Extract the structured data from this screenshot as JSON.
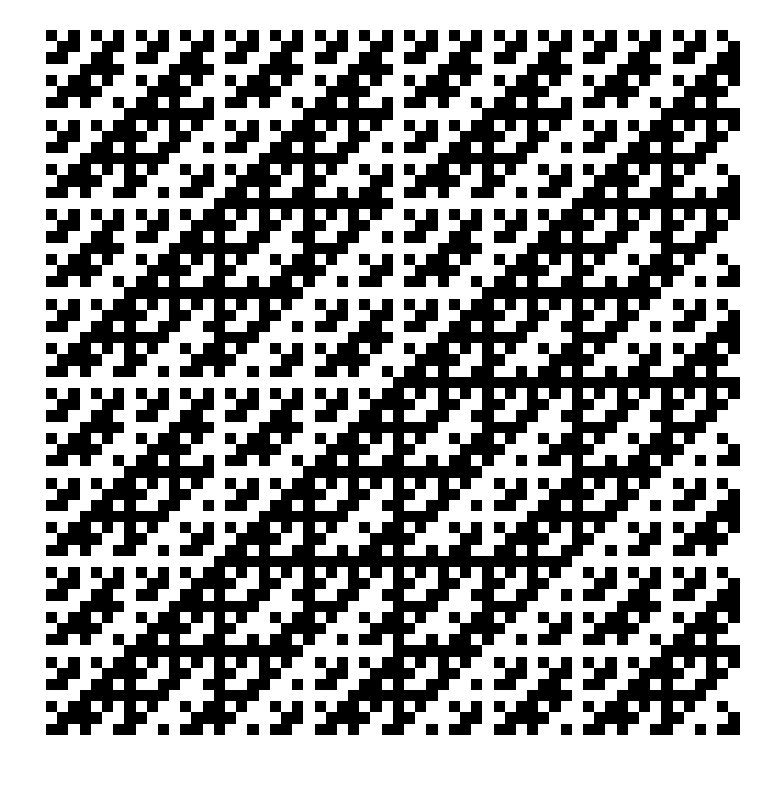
{
  "page": {
    "background_color": "#ffffff",
    "width": 774,
    "height": 788
  },
  "pattern": {
    "name": "sylvester-hadamard-parity-grid",
    "description": "Black/white square grid generated by the parity of the bitwise-AND popcount of row and column indices (Sylvester-Hadamard matrix), rendered as filled squares.",
    "rule": "cell(i,j) = popcount((i + row_offset) AND (j + col_offset)) mod 2",
    "row_offset": 1,
    "col_offset": 1,
    "on_color": "#000000",
    "off_color": "#ffffff",
    "cell_size_px": 11.2,
    "columns": 62,
    "rows": 64,
    "origin_x_px": 46,
    "origin_y_px": 30,
    "grid_lines": false,
    "symmetry": "diagonal"
  },
  "chart_data": {
    "type": "heatmap",
    "xlabel": "",
    "ylabel": "",
    "colorscale": [
      "#ffffff",
      "#000000"
    ],
    "zlim": [
      0,
      1
    ],
    "grid": false,
    "legend": "none",
    "nrows": 64,
    "ncols": 62,
    "generator": "popcount((i+1) & (j+1)) % 2"
  }
}
